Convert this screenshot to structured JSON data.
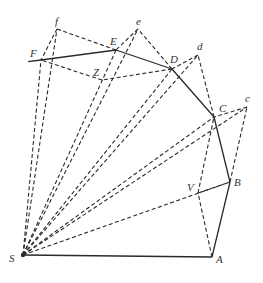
{
  "diagram": {
    "stroke_color": "#2a2a2a",
    "points": {
      "S": {
        "x": 23,
        "y": 255,
        "label": "S",
        "lx": 9,
        "ly": 262
      },
      "A": {
        "x": 212,
        "y": 257,
        "label": "A",
        "lx": 216,
        "ly": 263
      },
      "B": {
        "x": 230,
        "y": 182,
        "label": "B",
        "lx": 234,
        "ly": 186
      },
      "V": {
        "x": 198,
        "y": 193,
        "label": "V",
        "lx": 187,
        "ly": 191
      },
      "C": {
        "x": 214,
        "y": 117,
        "label": "C",
        "lx": 219,
        "ly": 112
      },
      "c": {
        "x": 247,
        "y": 107,
        "label": "c",
        "lx": 245,
        "ly": 102
      },
      "D": {
        "x": 172,
        "y": 69,
        "label": "D",
        "lx": 170,
        "ly": 63
      },
      "d": {
        "x": 198,
        "y": 55,
        "label": "d",
        "lx": 197,
        "ly": 50
      },
      "E": {
        "x": 116,
        "y": 50,
        "label": "E",
        "lx": 110,
        "ly": 45
      },
      "e": {
        "x": 138,
        "y": 29,
        "label": "e",
        "lx": 136,
        "ly": 25
      },
      "Z": {
        "x": 102,
        "y": 80,
        "label": "Z",
        "lx": 93,
        "ly": 76
      },
      "F": {
        "x": 41,
        "y": 60,
        "label": "F",
        "lx": 30,
        "ly": 57
      },
      "f": {
        "x": 57,
        "y": 29,
        "label": "f",
        "lx": 55,
        "ly": 25
      }
    },
    "labels": [
      "S",
      "A",
      "B",
      "V",
      "C",
      "c",
      "D",
      "d",
      "E",
      "e",
      "Z",
      "F",
      "f"
    ],
    "solid_segments": [
      [
        "S",
        "A"
      ],
      [
        "A",
        "B"
      ],
      [
        "B",
        "C"
      ],
      [
        "C",
        "D"
      ],
      [
        "D",
        "E"
      ],
      [
        "E",
        "F"
      ]
    ],
    "dashed_segments": [
      [
        "S",
        "B"
      ],
      [
        "S",
        "c"
      ],
      [
        "S",
        "C"
      ],
      [
        "S",
        "d"
      ],
      [
        "S",
        "D"
      ],
      [
        "S",
        "e"
      ],
      [
        "S",
        "E"
      ],
      [
        "S",
        "f"
      ],
      [
        "S",
        "F"
      ],
      [
        "B",
        "c"
      ],
      [
        "c",
        "C"
      ],
      [
        "V",
        "B"
      ],
      [
        "A",
        "V"
      ],
      [
        "V",
        "C"
      ],
      [
        "C",
        "d"
      ],
      [
        "d",
        "D"
      ],
      [
        "D",
        "Z"
      ],
      [
        "Z",
        "F"
      ],
      [
        "D",
        "e"
      ],
      [
        "e",
        "E"
      ],
      [
        "E",
        "f"
      ],
      [
        "f",
        "F"
      ]
    ]
  }
}
